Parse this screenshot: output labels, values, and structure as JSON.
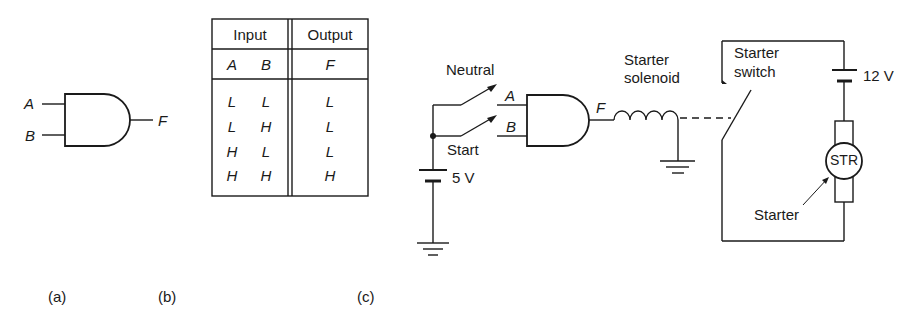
{
  "figure": {
    "panel_a": {
      "caption": "(a)",
      "gate": "AND",
      "inputs": [
        "A",
        "B"
      ],
      "output": "F"
    },
    "panel_b": {
      "caption": "(b)",
      "header": {
        "input": "Input",
        "output": "Output"
      },
      "subheader": {
        "a": "A",
        "b": "B",
        "f": "F"
      },
      "rows": [
        {
          "a": "L",
          "b": "L",
          "f": "L"
        },
        {
          "a": "L",
          "b": "H",
          "f": "L"
        },
        {
          "a": "H",
          "b": "L",
          "f": "L"
        },
        {
          "a": "H",
          "b": "H",
          "f": "H"
        }
      ]
    },
    "panel_c": {
      "caption": "(c)",
      "neutral_label": "Neutral",
      "start_label": "Start",
      "input_a": "A",
      "input_b": "B",
      "output_f": "F",
      "battery_low": "5 V",
      "solenoid_label_1": "Starter",
      "solenoid_label_2": "solenoid",
      "switch_label_1": "Starter",
      "switch_label_2": "switch",
      "battery_high": "12 V",
      "motor_label": "STR",
      "starter_label": "Starter"
    }
  }
}
